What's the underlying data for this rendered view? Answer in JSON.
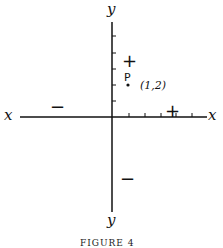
{
  "figure": {
    "caption": "FIGURE 4",
    "axes": {
      "x_label_left": "x",
      "x_label_right": "x",
      "y_label_top": "y",
      "y_label_bottom": "y"
    },
    "signs": {
      "x_negative": "−",
      "x_positive": "+",
      "y_positive": "+",
      "y_negative": "−"
    },
    "point": {
      "name": "P",
      "coords_label": "(1,2)",
      "x": 1,
      "y": 2
    },
    "ticks": {
      "x_positive_count": 5,
      "y_positive_count": 5
    }
  }
}
